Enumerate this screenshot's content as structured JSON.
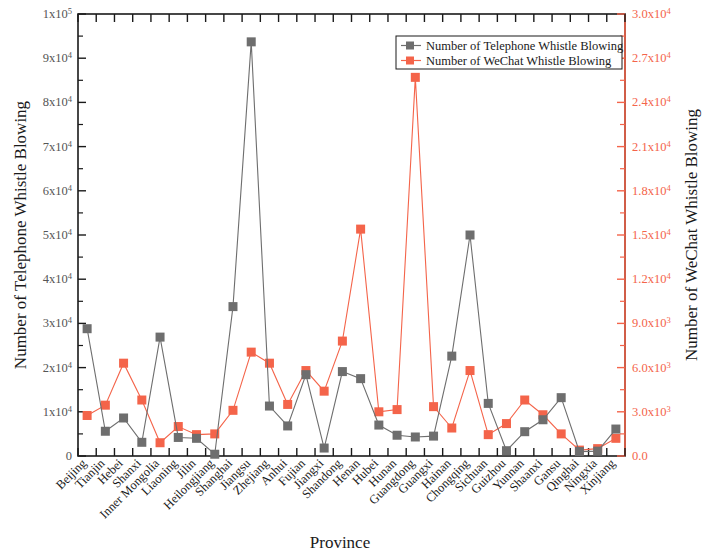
{
  "chart_data": {
    "type": "line",
    "title": "",
    "xlabel": "Province",
    "ylabel": "Number of Telephone Whistle Blowing",
    "y2label": "Number of WeChat Whistle Blowing",
    "grid": false,
    "legend_position": "top-right",
    "ylim": [
      0,
      100000
    ],
    "y2lim": [
      0,
      30000
    ],
    "categories": [
      "Beijing",
      "Tianjin",
      "Hebei",
      "Shanxi",
      "Inner Mongolia",
      "Liaoning",
      "Jilin",
      "Heilongjiang",
      "Shanghai",
      "Jiangsu",
      "Zhejiang",
      "Anhui",
      "Fujian",
      "Jiangxi",
      "Shandong",
      "Henan",
      "Hubei",
      "Hunan",
      "Guangdong",
      "Guangxi",
      "Hainan",
      "Chongqing",
      "Sichuan",
      "Guizhou",
      "Yunnan",
      "Shaanxi",
      "Gansu",
      "Qinghai",
      "Ningxia",
      "Xinjiang"
    ],
    "yticks": [
      0,
      10000,
      20000,
      30000,
      40000,
      50000,
      60000,
      70000,
      80000,
      90000,
      100000
    ],
    "ytick_labels": [
      "0",
      "1x10⁴",
      "2x10⁴",
      "3x10⁴",
      "4x10⁴",
      "5x10⁴",
      "6x10⁴",
      "7x10⁴",
      "8x10⁴",
      "9x10⁴",
      "1x10⁵"
    ],
    "y2ticks": [
      0,
      3000,
      6000,
      9000,
      12000,
      15000,
      18000,
      21000,
      24000,
      27000,
      30000
    ],
    "y2tick_labels": [
      "0.0",
      "3.0x10³",
      "6.0x10³",
      "9.0x10³",
      "1.2x10⁴",
      "1.5x10⁴",
      "1.8x10⁴",
      "2.1x10⁴",
      "2.4x10⁴",
      "2.7x10⁴",
      "3.0x10⁴"
    ],
    "series": [
      {
        "name": "Number of Telephone Whistle Blowing",
        "axis": "left",
        "color": "#6e6e6e",
        "marker": "square",
        "values": [
          28800,
          5600,
          8600,
          3100,
          26900,
          4200,
          4000,
          400,
          33800,
          93700,
          11300,
          6800,
          18400,
          1800,
          19100,
          17500,
          7000,
          4700,
          4300,
          4500,
          22600,
          50000,
          11900,
          1200,
          5500,
          8200,
          13200,
          1000,
          1100,
          6100
        ]
      },
      {
        "name": "Number of WeChat Whistle Blowing",
        "axis": "right",
        "color": "#f4644a",
        "marker": "square",
        "values": [
          2750,
          3450,
          6300,
          3800,
          900,
          2000,
          1450,
          1500,
          3100,
          7050,
          6300,
          3500,
          5800,
          4400,
          7800,
          15400,
          3000,
          3150,
          25700,
          3350,
          1900,
          5800,
          1450,
          2200,
          3800,
          2800,
          1500,
          400,
          500,
          1200
        ]
      }
    ]
  },
  "legend": {
    "entries": [
      {
        "label": "Number of Telephone Whistle Blowing",
        "color": "#6e6e6e"
      },
      {
        "label": "Number of WeChat Whistle Blowing",
        "color": "#f4644a"
      }
    ]
  }
}
